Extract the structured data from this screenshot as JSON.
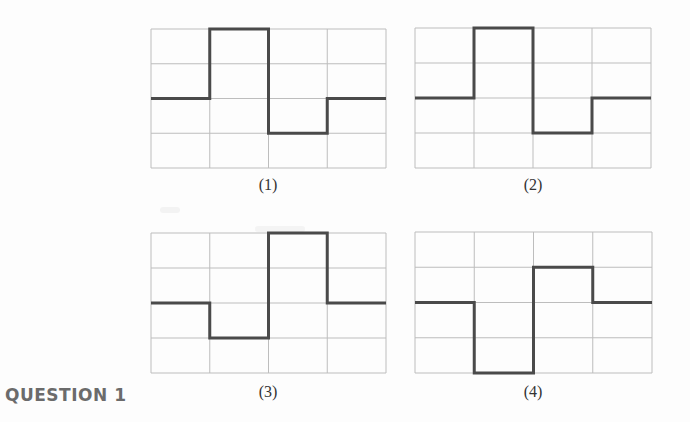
{
  "question": {
    "label": "QUESTION 1"
  },
  "grid": {
    "cols": 4,
    "rows": 4,
    "grid_color": "#bdbdbd",
    "line_color": "#4a4a4a"
  },
  "panels": [
    {
      "caption": "(1)",
      "x": 151,
      "y": 29,
      "w": 235,
      "h": 139,
      "levels": [
        0,
        2,
        -1,
        0
      ],
      "caption_x": 238,
      "caption_y": 176
    },
    {
      "caption": "(2)",
      "x": 415,
      "y": 28,
      "w": 236,
      "h": 140,
      "levels": [
        0,
        2,
        -1,
        0
      ],
      "caption_x": 503,
      "caption_y": 176
    },
    {
      "caption": "(3)",
      "x": 151,
      "y": 233,
      "w": 235,
      "h": 140,
      "levels": [
        0,
        -1,
        2,
        0
      ],
      "caption_x": 238,
      "caption_y": 383
    },
    {
      "caption": "(4)",
      "x": 415,
      "y": 232,
      "w": 237,
      "h": 141,
      "levels": [
        0,
        -2,
        1,
        0
      ],
      "caption_x": 503,
      "caption_y": 383
    }
  ],
  "chart_data": [
    {
      "type": "line",
      "title": "(1)",
      "x": [
        0,
        1,
        2,
        3,
        4
      ],
      "values": [
        0,
        2,
        -1,
        0
      ],
      "step": true,
      "ylim": [
        -2,
        2
      ],
      "grid": true
    },
    {
      "type": "line",
      "title": "(2)",
      "x": [
        0,
        1,
        2,
        3,
        4
      ],
      "values": [
        0,
        2,
        -1,
        0
      ],
      "step": true,
      "ylim": [
        -2,
        2
      ],
      "grid": true
    },
    {
      "type": "line",
      "title": "(3)",
      "x": [
        0,
        1,
        2,
        3,
        4
      ],
      "values": [
        0,
        -1,
        2,
        0
      ],
      "step": true,
      "ylim": [
        -2,
        2
      ],
      "grid": true
    },
    {
      "type": "line",
      "title": "(4)",
      "x": [
        0,
        1,
        2,
        3,
        4
      ],
      "values": [
        0,
        -2,
        1,
        0
      ],
      "step": true,
      "ylim": [
        -2,
        2
      ],
      "grid": true
    }
  ]
}
